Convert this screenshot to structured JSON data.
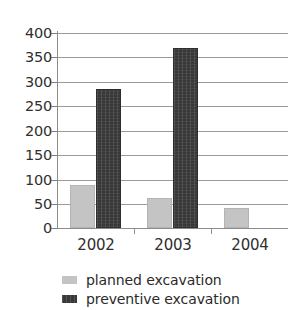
{
  "chart_data": {
    "type": "bar",
    "title": "",
    "subtitle": "",
    "xlabel": "",
    "ylabel": "",
    "categories": [
      "2002",
      "2003",
      "2004"
    ],
    "series": [
      {
        "name": "planned excavation",
        "color": "#c4c4c4",
        "values": [
          88,
          62,
          42
        ]
      },
      {
        "name": "preventive excavation",
        "color": "#383838",
        "values": [
          285,
          370,
          0
        ]
      }
    ],
    "ylim": [
      0,
      400
    ],
    "ytick_step": 50,
    "yticks": [
      400,
      350,
      300,
      250,
      200,
      150,
      100,
      50,
      0
    ],
    "ytick_labels": [
      "400",
      "350",
      "300",
      "250",
      "200",
      "150",
      "100",
      "50",
      "0"
    ],
    "grid": true,
    "grid_axis": "y",
    "legend_position": "bottom-left",
    "annotations": [],
    "background_color": "#ffffff",
    "axis_color": "#8c8c8c"
  },
  "legend": {
    "items": [
      {
        "label": "planned excavation",
        "swatch": "legend-swatch-planned"
      },
      {
        "label": "preventive excavation",
        "swatch": "legend-swatch-preventive"
      }
    ]
  }
}
